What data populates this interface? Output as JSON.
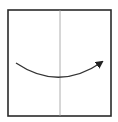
{
  "diagram": {
    "type": "fold-instruction",
    "square": {
      "x": 8,
      "y": 10,
      "width": 103,
      "height": 106,
      "stroke": "#2a2a2a",
      "stroke_width": 1.6
    },
    "center_line": {
      "x": 60,
      "y1": 10,
      "y2": 116,
      "stroke": "#9a9a9a",
      "stroke_width": 0.8
    },
    "arrow": {
      "direction": "left-to-right",
      "start": [
        16,
        63
      ],
      "control": [
        59,
        92
      ],
      "end": [
        102,
        62
      ],
      "stroke": "#333333",
      "stroke_width": 1.3
    }
  }
}
